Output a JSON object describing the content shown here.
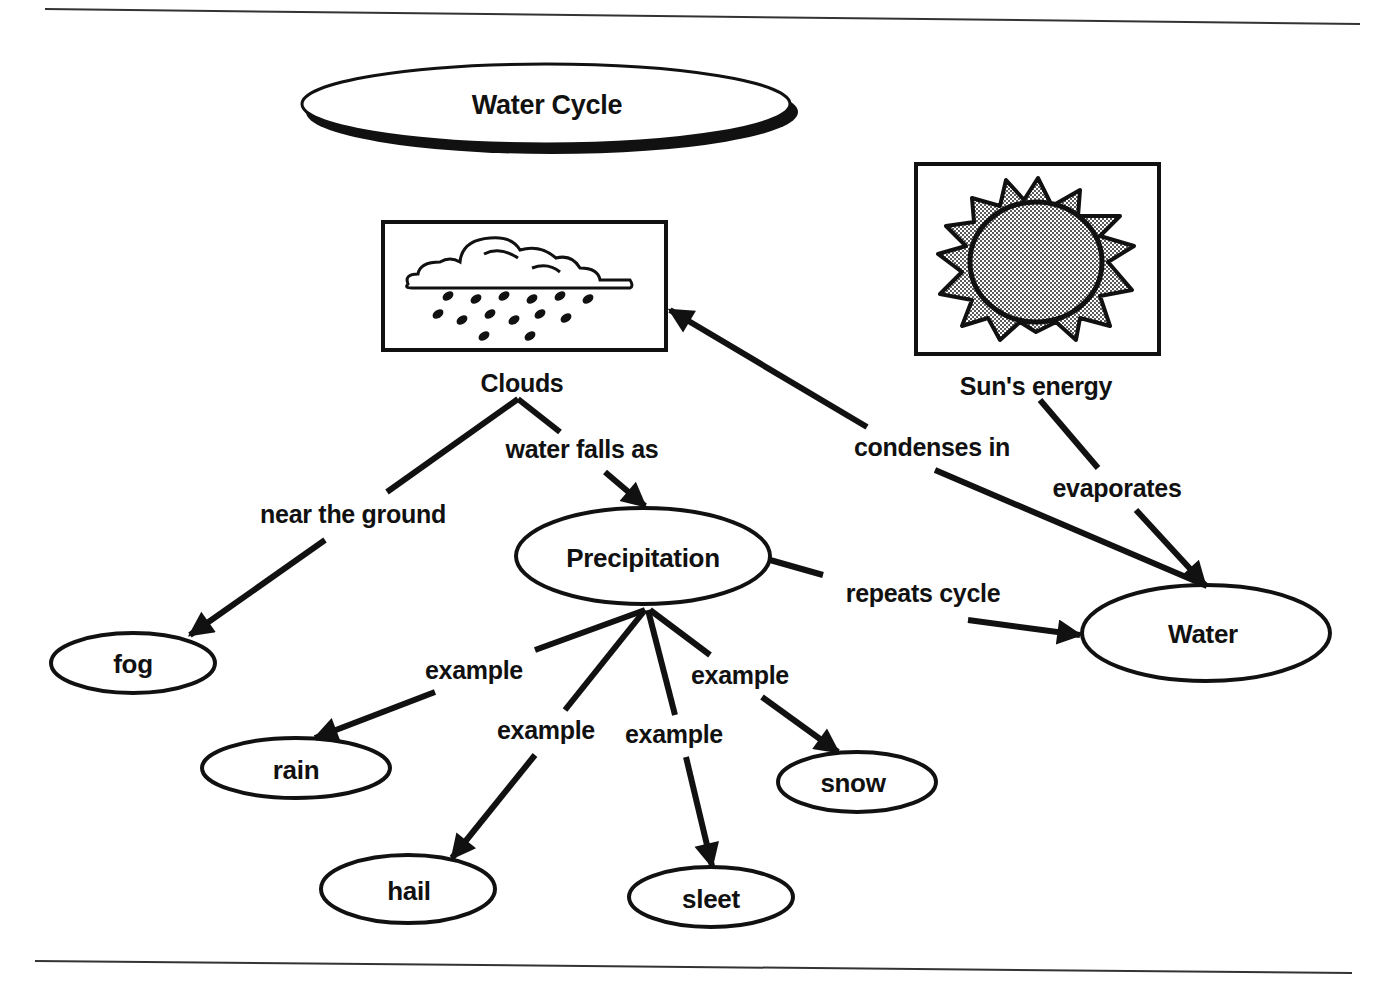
{
  "diagram": {
    "title": "Water Cycle",
    "colors": {
      "ink": "#111111",
      "background": "#ffffff",
      "sun_fill": "#9a9a9a"
    },
    "image_nodes": [
      {
        "id": "clouds",
        "label": "Clouds",
        "icon": "rain-cloud-icon"
      },
      {
        "id": "sun",
        "label": "Sun's energy",
        "icon": "sun-icon"
      }
    ],
    "nodes": [
      {
        "id": "precipitation",
        "label": "Precipitation"
      },
      {
        "id": "water",
        "label": "Water"
      },
      {
        "id": "fog",
        "label": "fog"
      },
      {
        "id": "rain",
        "label": "rain"
      },
      {
        "id": "hail",
        "label": "hail"
      },
      {
        "id": "sleet",
        "label": "sleet"
      },
      {
        "id": "snow",
        "label": "snow"
      }
    ],
    "edges": [
      {
        "from": "clouds",
        "to": "fog",
        "label": "near the ground"
      },
      {
        "from": "clouds",
        "to": "precipitation",
        "label": "water falls as"
      },
      {
        "from": "water",
        "to": "clouds",
        "label": "condenses in"
      },
      {
        "from": "sun",
        "to": "water",
        "label": "evaporates"
      },
      {
        "from": "precipitation",
        "to": "water",
        "label": "repeats cycle"
      },
      {
        "from": "precipitation",
        "to": "rain",
        "label": "example"
      },
      {
        "from": "precipitation",
        "to": "hail",
        "label": "example"
      },
      {
        "from": "precipitation",
        "to": "sleet",
        "label": "example"
      },
      {
        "from": "precipitation",
        "to": "snow",
        "label": "example"
      }
    ]
  }
}
